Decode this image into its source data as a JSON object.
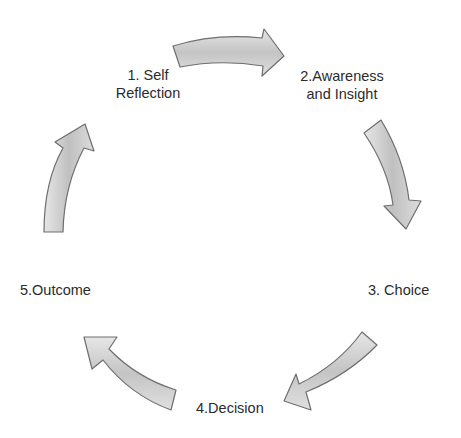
{
  "diagram": {
    "type": "cycle",
    "title": "",
    "steps": [
      {
        "number": "1",
        "lines": [
          "1. Self",
          "Reflection"
        ]
      },
      {
        "number": "2",
        "lines": [
          "2.Awareness",
          "and Insight"
        ]
      },
      {
        "number": "3",
        "lines": [
          "3. Choice"
        ]
      },
      {
        "number": "4",
        "lines": [
          "4.Decision"
        ]
      },
      {
        "number": "5",
        "lines": [
          "5.Outcome"
        ]
      }
    ],
    "arrows": [
      {
        "from": "1",
        "to": "2",
        "direction": "right"
      },
      {
        "from": "2",
        "to": "3",
        "direction": "down"
      },
      {
        "from": "3",
        "to": "4",
        "direction": "down-left"
      },
      {
        "from": "4",
        "to": "5",
        "direction": "up-left"
      },
      {
        "from": "5",
        "to": "1",
        "direction": "up"
      }
    ],
    "colors": {
      "arrow_fill_light": "#dedede",
      "arrow_fill_dark": "#b8b8b8",
      "arrow_stroke": "#6e6e6e",
      "text": "#2b2b2b",
      "background": "#ffffff"
    }
  }
}
